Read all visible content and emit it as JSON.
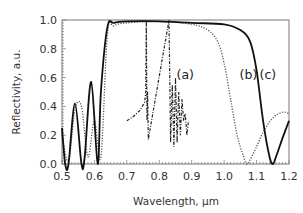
{
  "chart_data": {
    "type": "line",
    "title": "",
    "xlabel": "Wavelength, µm",
    "ylabel": "Reflectivity, a.u.",
    "xlim": [
      0.5,
      1.2
    ],
    "ylim": [
      0.0,
      1.0
    ],
    "grid": false,
    "legend": "none (inline annotations)",
    "xticks": [
      "0.5",
      "0.6",
      "0.7",
      "0.8",
      "0.9",
      "1.0",
      "1.1",
      "1.2"
    ],
    "yticks": [
      "0.0",
      "0.2",
      "0.4",
      "0.6",
      "0.8",
      "1.0"
    ],
    "annotations": [
      {
        "text": "(a)",
        "x": 0.88,
        "y": 0.59
      },
      {
        "text": "(b)",
        "x": 1.075,
        "y": 0.59
      },
      {
        "text": "(c)",
        "x": 1.135,
        "y": 0.59
      }
    ],
    "series": [
      {
        "name": "(a)",
        "style": "dash-dot",
        "x": [
          0.7,
          0.72,
          0.74,
          0.755,
          0.758,
          0.76,
          0.762,
          0.764,
          0.766,
          0.766,
          0.83,
          0.835,
          0.84,
          0.845,
          0.85,
          0.855,
          0.86,
          0.865,
          0.87,
          0.875,
          0.88,
          0.885,
          0.89
        ],
        "y": [
          0.3,
          0.33,
          0.37,
          0.43,
          0.5,
          1.0,
          0.3,
          0.5,
          0.17,
          0.17,
          1.0,
          0.15,
          0.55,
          0.12,
          0.6,
          0.15,
          0.5,
          0.2,
          0.45,
          0.3,
          0.35,
          0.2,
          0.3
        ]
      },
      {
        "name": "(b)",
        "style": "dotted",
        "x": [
          0.5,
          0.52,
          0.54,
          0.56,
          0.58,
          0.6,
          0.62,
          0.64,
          0.66,
          0.7,
          0.8,
          0.9,
          0.95,
          0.98,
          1.0,
          1.02,
          1.04,
          1.06,
          1.07,
          1.08,
          1.1,
          1.12,
          1.15,
          1.18,
          1.2
        ],
        "y": [
          0.2,
          0.02,
          0.38,
          0.4,
          0.05,
          0.3,
          0.05,
          0.9,
          0.96,
          0.98,
          0.99,
          0.97,
          0.93,
          0.85,
          0.7,
          0.45,
          0.2,
          0.05,
          0.0,
          0.03,
          0.12,
          0.22,
          0.32,
          0.36,
          0.35
        ]
      },
      {
        "name": "(c)",
        "style": "solid",
        "x": [
          0.5,
          0.51,
          0.52,
          0.54,
          0.56,
          0.57,
          0.59,
          0.61,
          0.62,
          0.64,
          0.66,
          0.7,
          0.8,
          0.9,
          1.0,
          1.05,
          1.08,
          1.1,
          1.12,
          1.14,
          1.15,
          1.16,
          1.18,
          1.2
        ],
        "y": [
          0.25,
          0.0,
          0.0,
          0.42,
          0.0,
          0.05,
          0.57,
          0.0,
          0.5,
          0.95,
          0.98,
          0.99,
          0.99,
          0.98,
          0.97,
          0.93,
          0.85,
          0.65,
          0.3,
          0.05,
          0.0,
          0.05,
          0.18,
          0.3
        ]
      }
    ]
  }
}
